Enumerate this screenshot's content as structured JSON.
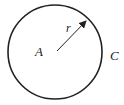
{
  "diagram": {
    "type": "circle-with-radius",
    "circle": {
      "cx": 55,
      "cy": 52,
      "r": 47,
      "stroke": "#222222"
    },
    "radius_arrow": {
      "x1": 57,
      "y1": 51,
      "x2": 87,
      "y2": 20
    },
    "labels": {
      "center": "A",
      "radius": "r",
      "circle": "C"
    }
  }
}
